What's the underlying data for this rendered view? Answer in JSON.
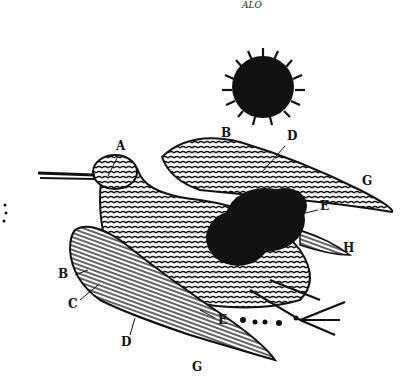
{
  "illustration": {
    "subject": "engraving of a wading bird (snipe/woodcock) with lettered parts and ink blots",
    "caption_top": "ALO",
    "colors": {
      "ink": "#111111",
      "paper": "#ffffff"
    },
    "labels": [
      {
        "id": "A",
        "text": "A",
        "x": 116,
        "y": 146
      },
      {
        "id": "B-upper",
        "text": "B",
        "x": 221,
        "y": 132
      },
      {
        "id": "D-upper",
        "text": "D",
        "x": 287,
        "y": 134
      },
      {
        "id": "G-upper",
        "text": "G",
        "x": 362,
        "y": 180
      },
      {
        "id": "E-upper",
        "text": "E",
        "x": 320,
        "y": 205
      },
      {
        "id": "H",
        "text": "H",
        "x": 343,
        "y": 247
      },
      {
        "id": "B-lower",
        "text": "B",
        "x": 58,
        "y": 267
      },
      {
        "id": "C",
        "text": "C",
        "x": 68,
        "y": 297
      },
      {
        "id": "D-lower",
        "text": "D",
        "x": 121,
        "y": 337
      },
      {
        "id": "E-lower",
        "text": "E",
        "x": 218,
        "y": 313
      },
      {
        "id": "G-lower",
        "text": "G",
        "x": 192,
        "y": 361
      }
    ]
  }
}
